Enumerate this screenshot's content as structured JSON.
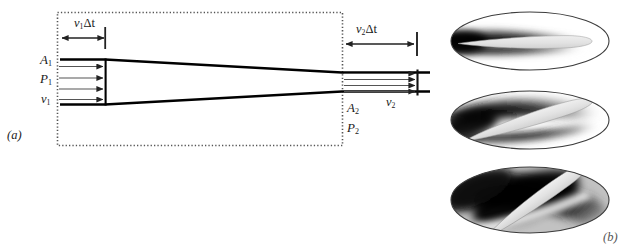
{
  "figure": {
    "caption_tags": {
      "left_panel": "(a)",
      "right_panel": "(b)"
    },
    "background_color": "#ffffff",
    "ink_color": "#1a1a1a"
  },
  "panel_a": {
    "name": "flow-tube-continuity-diagram",
    "tag": "(a)",
    "control_volume": {
      "style": "dotted-rectangle",
      "stroke_color": "#555555"
    },
    "inlet": {
      "displacement_label": "v",
      "displacement_sub": "1",
      "displacement_delta": "Δt",
      "area_label": "A",
      "area_sub": "1",
      "pressure_label": "P",
      "pressure_sub": "1",
      "velocity_label": "v",
      "velocity_sub": "1",
      "arrow_count": 4
    },
    "outlet": {
      "displacement_label": "v",
      "displacement_sub": "2",
      "displacement_delta": "Δt",
      "area_label": "A",
      "area_sub": "2",
      "pressure_label": "P",
      "pressure_sub": "2",
      "velocity_label": "v",
      "velocity_sub": "2",
      "arrow_count": 4
    },
    "tube": {
      "description": "converging stream tube, wide at left narrow at right",
      "stroke_color": "#000000"
    }
  },
  "panel_b": {
    "name": "airfoil-flow-visualization-series",
    "tag": "(b)",
    "images": [
      {
        "name": "airfoil-zero-angle-of-attack",
        "angle_deg": 0,
        "description": "airfoil in elliptical wind-tunnel frame, smoke streamlines attached, dark wake band above and below"
      },
      {
        "name": "airfoil-moderate-angle-of-attack",
        "angle_deg": -16,
        "description": "airfoil tilted nose-up, thickening dark separation region over upper surface"
      },
      {
        "name": "airfoil-stalled-high-angle-of-attack",
        "angle_deg": -34,
        "description": "airfoil at steep angle, large dark stalled separation wake covering upper surface"
      }
    ]
  }
}
